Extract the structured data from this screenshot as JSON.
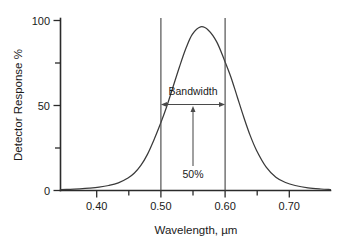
{
  "chart_data": {
    "type": "line",
    "title": "",
    "xlabel": "Wavelength, µm",
    "ylabel": "Detector Response %",
    "xlim": [
      0.335,
      0.755
    ],
    "ylim": [
      0,
      103
    ],
    "grid": false,
    "legend": null,
    "x_ticks": [
      {
        "value": 0.4,
        "label": "0.40",
        "major": true
      },
      {
        "value": 0.45,
        "label": "",
        "major": false
      },
      {
        "value": 0.5,
        "label": "0.50",
        "major": true
      },
      {
        "value": 0.55,
        "label": "",
        "major": false
      },
      {
        "value": 0.6,
        "label": "0.60",
        "major": true
      },
      {
        "value": 0.65,
        "label": "",
        "major": false
      },
      {
        "value": 0.7,
        "label": "0.70",
        "major": true
      }
    ],
    "y_ticks": [
      {
        "value": 0,
        "label": "0",
        "major": true
      },
      {
        "value": 25,
        "label": "",
        "major": false
      },
      {
        "value": 50,
        "label": "50",
        "major": true
      },
      {
        "value": 75,
        "label": "",
        "major": false
      },
      {
        "value": 100,
        "label": "100",
        "major": true
      }
    ],
    "series": [
      {
        "name": "Detector spectral response",
        "shape": "bell-curve",
        "peak_x": 0.553,
        "peak_y": 98,
        "half_width_at_half_max": 0.05,
        "x": [
          0.335,
          0.35,
          0.365,
          0.38,
          0.395,
          0.41,
          0.425,
          0.44,
          0.45,
          0.46,
          0.47,
          0.48,
          0.49,
          0.5,
          0.51,
          0.52,
          0.53,
          0.54,
          0.553,
          0.565,
          0.578,
          0.59,
          0.6,
          0.61,
          0.62,
          0.63,
          0.64,
          0.655,
          0.67,
          0.685,
          0.7,
          0.72,
          0.74,
          0.755
        ],
        "y": [
          0.5,
          0.7,
          1.0,
          1.4,
          2.0,
          3.0,
          4.6,
          7.5,
          10.5,
          15.0,
          21.5,
          30.0,
          39.5,
          50.0,
          62.0,
          74.0,
          85.0,
          93.5,
          98.0,
          96.0,
          89.0,
          78.0,
          68.0,
          56.0,
          44.0,
          33.0,
          24.0,
          14.0,
          8.0,
          4.8,
          3.0,
          1.6,
          0.9,
          0.6
        ]
      }
    ],
    "markers": [
      {
        "type": "vertical-line",
        "x": 0.5,
        "name": "lower-cutoff"
      },
      {
        "type": "vertical-line",
        "x": 0.6,
        "name": "upper-cutoff"
      }
    ],
    "annotations": [
      {
        "name": "bandwidth",
        "label": "Bandwidth",
        "type": "double-arrow",
        "x_start": 0.5,
        "x_end": 0.6,
        "y": 52
      },
      {
        "name": "half-max",
        "label": "50%",
        "type": "up-arrow",
        "x": 0.553,
        "y_start": 14,
        "y_end": 50
      }
    ]
  },
  "axis": {
    "y_title": "Detector Response %",
    "x_title": "Wavelength, µm"
  }
}
